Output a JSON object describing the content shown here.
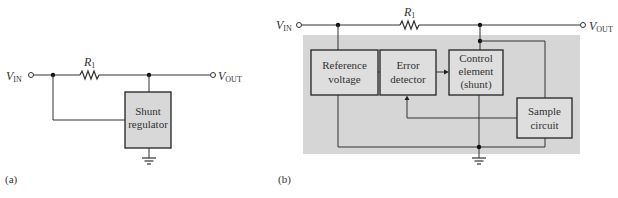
{
  "diagram_a": {
    "caption": "(a)",
    "vin_label": "V",
    "vin_sub": "IN",
    "vout_label": "V",
    "vout_sub": "OUT",
    "resistor_label": "R",
    "resistor_sub": "1",
    "block": {
      "line1": "Shunt",
      "line2": "regulator"
    }
  },
  "diagram_b": {
    "caption": "(b)",
    "vin_label": "V",
    "vin_sub": "IN",
    "vout_label": "V",
    "vout_sub": "OUT",
    "resistor_label": "R",
    "resistor_sub": "1",
    "blocks": {
      "reference": {
        "line1": "Reference",
        "line2": "voltage"
      },
      "error": {
        "line1": "Error",
        "line2": "detector"
      },
      "control": {
        "line1": "Control",
        "line2": "element",
        "line3": "(shunt)"
      },
      "sample": {
        "line1": "Sample",
        "line2": "circuit"
      }
    }
  },
  "colors": {
    "wire": "#333333",
    "block_fill": "#dcdcdc",
    "panel_fill": "#d3d3d3",
    "label": "#555555"
  }
}
